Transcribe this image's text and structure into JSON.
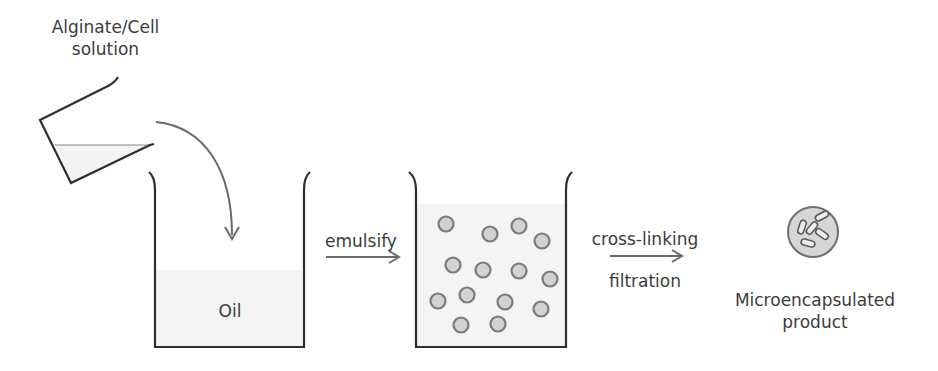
{
  "labels": {
    "source_line1": "Alginate/Cell",
    "source_line2": "solution",
    "oil": "Oil",
    "step1": "emulsify",
    "step2_line1": "cross-linking",
    "step2_line2": "filtration",
    "product_line1": "Microencapsulated",
    "product_line2": "product"
  },
  "colors": {
    "outline": "#2e2e2e",
    "arrow": "#6a6a6a",
    "liquid": "#f3f3f3",
    "bead_fill": "#d2d2d2",
    "bead_stroke": "#7a7a7a"
  },
  "beads": [
    [
      446,
      224
    ],
    [
      490,
      234
    ],
    [
      519,
      226
    ],
    [
      542,
      241
    ],
    [
      453,
      265
    ],
    [
      483,
      270
    ],
    [
      519,
      271
    ],
    [
      550,
      279
    ],
    [
      438,
      301
    ],
    [
      467,
      295
    ],
    [
      505,
      302
    ],
    [
      541,
      309
    ],
    [
      461,
      325
    ],
    [
      498,
      324
    ]
  ]
}
